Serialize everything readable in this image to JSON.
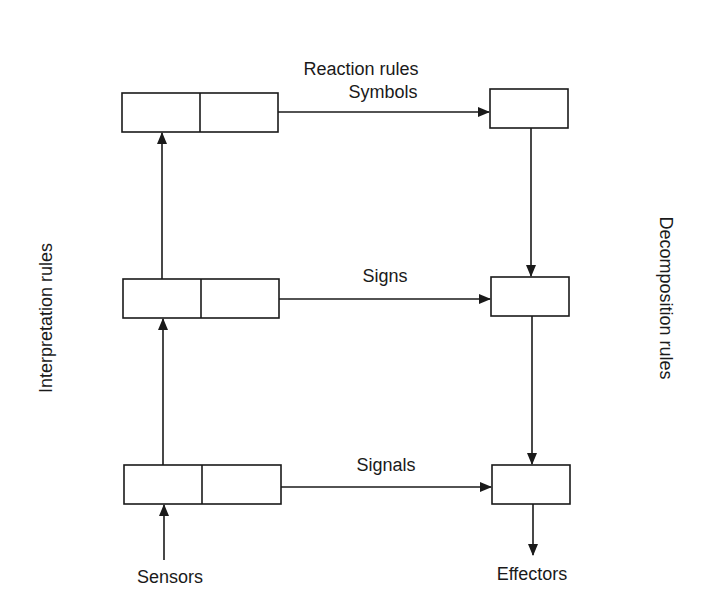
{
  "diagram": {
    "title_top": "Reaction rules",
    "label_left": "Interpretation rules",
    "label_right": "Decomposition rules",
    "levels": [
      {
        "name": "symbols",
        "label": "Symbols"
      },
      {
        "name": "signs",
        "label": "Signs"
      },
      {
        "name": "signals",
        "label": "Signals"
      }
    ],
    "input_label": "Sensors",
    "output_label": "Effectors",
    "stroke_color": "#1a1a1a",
    "background_color": "#ffffff"
  }
}
